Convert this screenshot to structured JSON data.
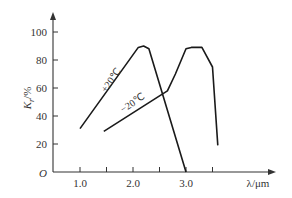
{
  "chart_data": {
    "type": "line",
    "title": "",
    "xlabel": "λ/μm",
    "ylabel": "K_r/%",
    "ylabel_main": "K",
    "ylabel_sub": "r",
    "ylabel_unit": "/%",
    "origin_label": "O",
    "xlim": [
      0.5,
      4.3
    ],
    "ylim": [
      0,
      105
    ],
    "x_ticks": [
      1.0,
      1.5,
      2.0,
      2.5,
      3.0,
      3.5
    ],
    "x_tick_labels": [
      "1.0",
      "",
      "2.0",
      "",
      "3.0",
      ""
    ],
    "y_ticks": [
      20,
      40,
      60,
      80,
      100
    ],
    "y_tick_labels": [
      "20",
      "40",
      "60",
      "80",
      "100"
    ],
    "grid": false,
    "legend": "inline labels on curves",
    "series": [
      {
        "name": "+20℃",
        "label": "+20℃",
        "x": [
          1.0,
          2.1,
          2.2,
          2.3,
          3.0
        ],
        "y": [
          31,
          89,
          90,
          88,
          0
        ]
      },
      {
        "name": "−20℃",
        "label": "−20℃",
        "x": [
          1.45,
          2.65,
          2.8,
          3.0,
          3.1,
          3.3,
          3.5,
          3.6
        ],
        "y": [
          29,
          58,
          70,
          88,
          89,
          89,
          75,
          19
        ]
      }
    ]
  }
}
